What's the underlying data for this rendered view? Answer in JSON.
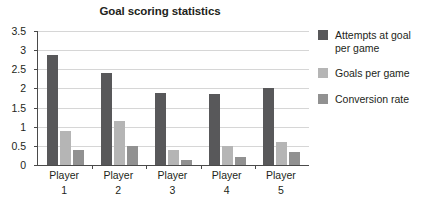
{
  "chart_data": {
    "type": "bar",
    "title": "Goal scoring statistics",
    "xlabel": "",
    "ylabel": "",
    "categories": [
      "Player 1",
      "Player 2",
      "Player 3",
      "Player 4",
      "Player 5"
    ],
    "category_lines": [
      [
        "Player",
        "1"
      ],
      [
        "Player",
        "2"
      ],
      [
        "Player",
        "3"
      ],
      [
        "Player",
        "4"
      ],
      [
        "Player",
        "5"
      ]
    ],
    "series": [
      {
        "name": "Attempts at goal per game",
        "name_lines": [
          "Attempts at goal",
          "per game"
        ],
        "color": "#58585a",
        "values": [
          2.87,
          2.4,
          1.87,
          1.86,
          2.0
        ]
      },
      {
        "name": "Goals per game",
        "name_lines": [
          "Goals per game"
        ],
        "color": "#b5b5b5",
        "values": [
          0.88,
          1.15,
          0.4,
          0.5,
          0.61
        ]
      },
      {
        "name": "Conversion rate",
        "name_lines": [
          "Conversion rate"
        ],
        "color": "#919191",
        "values": [
          0.39,
          0.5,
          0.13,
          0.2,
          0.33
        ]
      }
    ],
    "ylim": [
      0,
      3.5
    ],
    "ytick_values": [
      0,
      0.5,
      1,
      1.5,
      2,
      2.5,
      3,
      3.5
    ],
    "ytick_labels": [
      "0",
      "0.5",
      "1",
      "1.5",
      "2",
      "2.5",
      "3",
      "3.5"
    ],
    "grid": "horizontal",
    "legend_position": "right",
    "background": "#ffffff",
    "axis_color": "#4a4a4a",
    "grid_color": "#d6d6d6"
  }
}
